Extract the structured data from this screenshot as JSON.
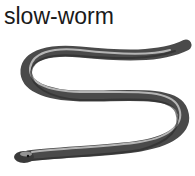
{
  "caption": "slow-worm",
  "illustration": {
    "subject": "slow-worm",
    "style": "monochrome engraving",
    "colors": {
      "body_dark": "#3a3a3a",
      "body_mid": "#7a7a7a",
      "highlight": "#d8d8d8"
    }
  }
}
